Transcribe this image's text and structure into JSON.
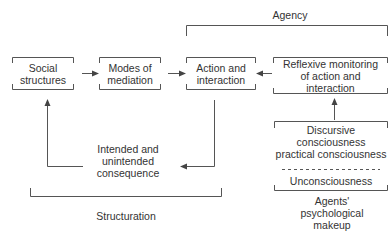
{
  "diagram": {
    "title": "Structuration",
    "colors": {
      "line": "#555555",
      "text": "#333333",
      "background": "#ffffff"
    },
    "brackets": {
      "agency": {
        "label": "Agency"
      },
      "structuration": {
        "label": "Structuration"
      }
    },
    "nodes": {
      "social_structures": {
        "lines": [
          "Social",
          "structures"
        ]
      },
      "modes_of_mediation": {
        "lines": [
          "Modes of",
          "mediation"
        ]
      },
      "action_and_interaction": {
        "lines": [
          "Action and",
          "interaction"
        ]
      },
      "reflexive_monitoring": {
        "lines": [
          "Reflexive monitoring",
          "of action and",
          "interaction"
        ]
      },
      "consequence": {
        "lines": [
          "Intended and",
          "unintended",
          "consequence"
        ]
      },
      "consciousness": {
        "lines": [
          "Discursive",
          "consciousness",
          "practical consciousness"
        ],
        "divider": "- - - - - - - - - - - - - - - -",
        "unconscious": "Unconsciousness"
      },
      "psychological_makeup": {
        "lines": [
          "Agents'",
          "psychological",
          "makeup"
        ]
      }
    },
    "edges": [
      {
        "from": "Social structures",
        "to": "Modes of mediation"
      },
      {
        "from": "Modes of mediation",
        "to": "Action and interaction"
      },
      {
        "from": "Reflexive monitoring of action and interaction",
        "to": "Action and interaction"
      },
      {
        "from": "Action and interaction",
        "to": "Intended and unintended consequence"
      },
      {
        "from": "Intended and unintended consequence",
        "to": "Social structures"
      },
      {
        "from": "Discursive consciousness practical consciousness",
        "to": "Reflexive monitoring of action and interaction"
      }
    ]
  }
}
